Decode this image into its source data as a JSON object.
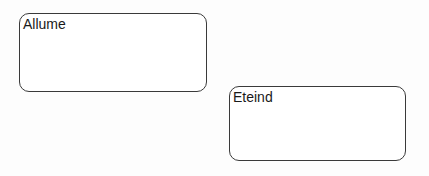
{
  "diagram": {
    "states": [
      {
        "label": "Allume"
      },
      {
        "label": "Eteind"
      }
    ]
  }
}
